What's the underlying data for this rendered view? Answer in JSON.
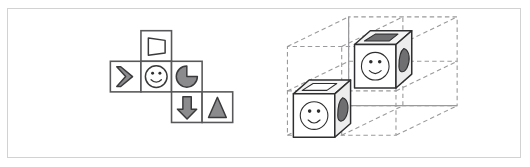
{
  "figure": {
    "border_color": "#d2d2d2",
    "background_color": "#ffffff"
  },
  "panels": [
    {
      "id": "cube-net",
      "name": "cube-net-panel",
      "description": "Unfolded cube net made of six square cells arranged in a T/Z layout"
    },
    {
      "id": "grid-3d",
      "name": "three-d-grid-panel",
      "description": "Dashed wireframe 2x2x2 box containing two small symbol cubes"
    }
  ],
  "net": {
    "cell_size": 30,
    "stroke_color": "#58585a",
    "fill_color": "#ffffff",
    "cells": [
      {
        "name": "net-cell-top",
        "row": 0,
        "col": 1,
        "symbol": "trapezoid-outline-icon",
        "symbol_label": "trapezoid outline",
        "fill": "hollow"
      },
      {
        "name": "net-cell-middle-left",
        "row": 1,
        "col": 0,
        "symbol": "chevron-right-icon",
        "symbol_label": "right chevron",
        "fill": "gray"
      },
      {
        "name": "net-cell-middle-center",
        "row": 1,
        "col": 1,
        "symbol": "smiley-face-icon",
        "symbol_label": "smiley face",
        "fill": "hollow"
      },
      {
        "name": "net-cell-middle-right",
        "row": 1,
        "col": 2,
        "symbol": "pacman-pie-icon",
        "symbol_label": "pac-man pie wedge",
        "fill": "gray"
      },
      {
        "name": "net-cell-bottom-left",
        "row": 2,
        "col": 2,
        "symbol": "arrow-down-icon",
        "symbol_label": "down arrow",
        "fill": "gray"
      },
      {
        "name": "net-cell-bottom-right",
        "row": 2,
        "col": 3,
        "symbol": "triangle-up-icon",
        "symbol_label": "up triangle",
        "fill": "gray"
      }
    ]
  },
  "grid": {
    "divisions": 2,
    "wire_color": "#9a9a9c",
    "dash_pattern": "4.5 3.2",
    "solid_edges_color": "#9a9a9c",
    "cubes": [
      {
        "name": "symbol-cube-upper",
        "position_label": "upper-back cell",
        "faces": {
          "front": "smiley-face-icon",
          "top": "trapezoid-outline-icon",
          "right": "pacman-pie-icon"
        }
      },
      {
        "name": "symbol-cube-lower",
        "position_label": "lower-front cell",
        "faces": {
          "front": "smiley-face-icon",
          "top": "trapezoid-outline-icon",
          "right": "pacman-pie-icon"
        }
      }
    ]
  },
  "colors": {
    "shape_gray": "#8b8b8d",
    "shape_outline": "#3a3a3c",
    "cube_outline": "#2e2e30",
    "cube_dark_symbol": "#6f6f72",
    "wireframe": "#9a9a9c",
    "net_cell_stroke": "#58585a"
  }
}
